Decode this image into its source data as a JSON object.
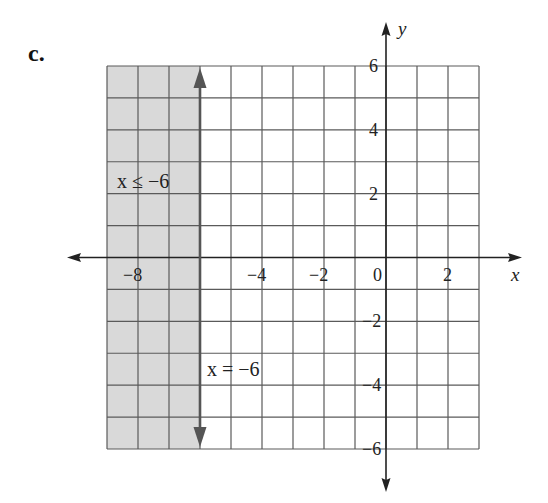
{
  "part_label": "c.",
  "colors": {
    "shade": "#d9d9d9",
    "grid": "#5a5a5a",
    "axis": "#222222",
    "boundary": "#555555",
    "text": "#222222"
  },
  "chart_data": {
    "type": "inequality-graph",
    "title": "",
    "xlabel": "x",
    "ylabel": "y",
    "xlim": [
      -9,
      3
    ],
    "ylim": [
      -6,
      6
    ],
    "grid": true,
    "grid_step": 1,
    "x_tick_labels": [
      {
        "value": -8,
        "label": "−8"
      },
      {
        "value": -4,
        "label": "−4"
      },
      {
        "value": -2,
        "label": "−2"
      },
      {
        "value": 0,
        "label": "0"
      },
      {
        "value": 2,
        "label": "2"
      }
    ],
    "y_tick_labels": [
      {
        "value": 6,
        "label": "6"
      },
      {
        "value": 4,
        "label": "4"
      },
      {
        "value": 2,
        "label": "2"
      },
      {
        "value": -2,
        "label": "−2"
      },
      {
        "value": -4,
        "label": "−4"
      },
      {
        "value": -6,
        "label": "−6"
      }
    ],
    "boundary_line": {
      "equation": "x = -6",
      "x": -6,
      "style": "solid",
      "arrows": "both"
    },
    "shaded_region": {
      "inequality": "x ≤ -6",
      "x_from": -9,
      "x_to": -6
    },
    "annotations": [
      {
        "text": "x ≤ −6",
        "x": -8.5,
        "y": 2.5
      },
      {
        "text": "x = −6",
        "x": -5.8,
        "y": -3.5
      }
    ]
  }
}
